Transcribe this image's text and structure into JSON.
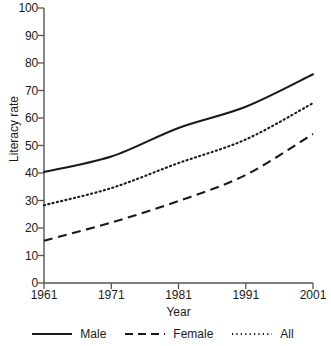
{
  "chart_data": {
    "type": "line",
    "title": "",
    "xlabel": "Year",
    "ylabel": "Literacy rate",
    "x": [
      1961,
      1971,
      1981,
      1991,
      2001
    ],
    "xticklabels": [
      "1961",
      "1971",
      "1981",
      "1991",
      "2001"
    ],
    "xlim": [
      1961,
      2001
    ],
    "ylim": [
      0,
      100
    ],
    "yticks": [
      0,
      10,
      20,
      30,
      40,
      50,
      60,
      70,
      80,
      90,
      100
    ],
    "yticklabels": [
      "0",
      "10",
      "20",
      "30",
      "40",
      "50",
      "60",
      "70",
      "80",
      "90",
      "100"
    ],
    "grid": false,
    "legend_position": "bottom",
    "series": [
      {
        "name": "Male",
        "style": "solid",
        "color": "#1a1a1a",
        "values": [
          40.4,
          46.0,
          56.4,
          64.1,
          75.9
        ]
      },
      {
        "name": "Female",
        "style": "dashed",
        "color": "#1a1a1a",
        "values": [
          15.4,
          22.0,
          29.8,
          39.3,
          54.2
        ]
      },
      {
        "name": "All",
        "style": "dotted",
        "color": "#1a1a1a",
        "values": [
          28.3,
          34.5,
          43.6,
          52.2,
          65.4
        ]
      }
    ]
  },
  "axes": {
    "y_title": "Literacy rate",
    "x_title": "Year"
  },
  "legend": {
    "items": [
      {
        "label": "Male",
        "style": "solid"
      },
      {
        "label": "Female",
        "style": "dashed"
      },
      {
        "label": "All",
        "style": "dotted"
      }
    ]
  },
  "colors": {
    "ink": "#1a1a1a",
    "axis": "#555555",
    "background": "#ffffff"
  }
}
